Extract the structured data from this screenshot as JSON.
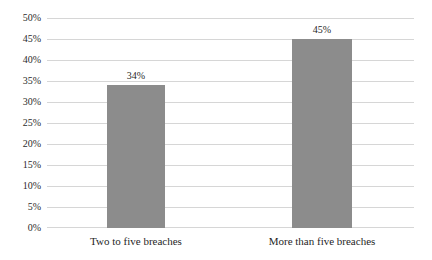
{
  "chart_data": {
    "type": "bar",
    "title": "",
    "subtitle": "",
    "xlabel": "",
    "ylabel": "",
    "categories": [
      "Two to five breaches",
      "More than five breaches"
    ],
    "values": [
      34,
      45
    ],
    "value_labels": [
      "34%",
      "45%"
    ],
    "ylim": [
      0,
      50
    ],
    "ytick_step": 5,
    "ytick_labels": [
      "50%",
      "45%",
      "40%",
      "35%",
      "30%",
      "25%",
      "20%",
      "15%",
      "10%",
      "5%",
      "0%"
    ],
    "ytick_values": [
      50,
      45,
      40,
      35,
      30,
      25,
      20,
      15,
      10,
      5,
      0
    ],
    "grid": true,
    "legend": false,
    "bar_color": "#8c8c8c",
    "gridline_color": "#d6d6d6",
    "background_color": "#ffffff",
    "text_color": "#1f1f1f"
  }
}
